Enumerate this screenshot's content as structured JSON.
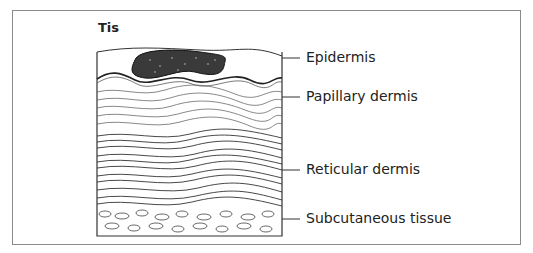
{
  "figure": {
    "title": "Tis",
    "labels": [
      {
        "text": "Epidermis",
        "y": 58
      },
      {
        "text": "Papillary dermis",
        "y": 97
      },
      {
        "text": "Reticular dermis",
        "y": 170
      },
      {
        "text": "Subcutaneous tissue",
        "y": 219
      }
    ]
  }
}
